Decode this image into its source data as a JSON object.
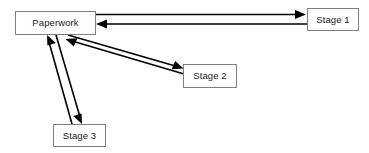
{
  "diagram": {
    "type": "flow-diagram",
    "background_color": "#ffffff",
    "line_color": "#000000",
    "box_border_color": "#7d7d7d",
    "box_fill_color": "#ffffff",
    "text_color": "#1a1a1a",
    "nodes": [
      {
        "id": "paperwork",
        "label": "Paperwork",
        "x": 15,
        "y": 11,
        "width": 81,
        "height": 24
      },
      {
        "id": "stage1",
        "label": "Stage 1",
        "x": 307,
        "y": 8,
        "width": 52,
        "height": 23
      },
      {
        "id": "stage2",
        "label": "Stage 2",
        "x": 183,
        "y": 64,
        "width": 54,
        "height": 24
      },
      {
        "id": "stage3",
        "label": "Stage 3",
        "x": 53,
        "y": 124,
        "width": 53,
        "height": 23
      }
    ],
    "edges": [
      {
        "id": "paperwork-to-stage1",
        "from": "paperwork",
        "to": "stage1",
        "direction": "forward",
        "style": "solid",
        "arrowhead": "filled-triangle"
      },
      {
        "id": "stage1-to-paperwork",
        "from": "stage1",
        "to": "paperwork",
        "direction": "forward",
        "style": "solid",
        "arrowhead": "filled-triangle"
      },
      {
        "id": "paperwork-to-stage2",
        "from": "paperwork",
        "to": "stage2",
        "direction": "forward",
        "style": "solid",
        "arrowhead": "filled-triangle"
      },
      {
        "id": "stage2-to-paperwork",
        "from": "stage2",
        "to": "paperwork",
        "direction": "forward",
        "style": "solid",
        "arrowhead": "filled-triangle"
      },
      {
        "id": "paperwork-to-stage3",
        "from": "paperwork",
        "to": "stage3",
        "direction": "forward",
        "style": "solid",
        "arrowhead": "filled-triangle"
      },
      {
        "id": "stage3-to-paperwork",
        "from": "stage3",
        "to": "paperwork",
        "direction": "forward",
        "style": "solid",
        "arrowhead": "filled-triangle"
      }
    ]
  }
}
